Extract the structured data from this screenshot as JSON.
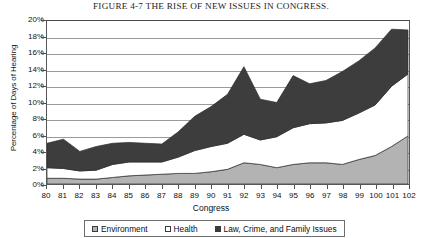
{
  "figure": {
    "title": "FIGURE 4-7  THE RISE OF NEW ISSUES IN CONGRESS."
  },
  "chart_data": {
    "type": "area",
    "stacked": true,
    "title": "FIGURE 4-7  THE RISE OF NEW ISSUES IN CONGRESS.",
    "xlabel": "Congress",
    "ylabel": "Percentage of Days of Hearing",
    "categories": [
      "80",
      "81",
      "82",
      "83",
      "84",
      "85",
      "86",
      "87",
      "88",
      "89",
      "90",
      "91",
      "92",
      "93",
      "94",
      "95",
      "96",
      "97",
      "98",
      "99",
      "100",
      "101",
      "102"
    ],
    "ylim": [
      0,
      20
    ],
    "yticks": [
      "0%",
      "2%",
      "4%",
      "6%",
      "8%",
      "10%",
      "12%",
      "14%",
      "16%",
      "18%",
      "20%"
    ],
    "ytick_values": [
      0,
      2,
      4,
      6,
      8,
      10,
      12,
      14,
      16,
      18,
      20
    ],
    "grid": true,
    "legend_position": "bottom",
    "series": [
      {
        "name": "Environment",
        "color": "#b3b3b3",
        "values": [
          0.7,
          0.7,
          0.6,
          0.6,
          0.8,
          1.0,
          1.1,
          1.2,
          1.3,
          1.3,
          1.5,
          1.8,
          2.6,
          2.4,
          2.0,
          2.4,
          2.6,
          2.6,
          2.4,
          3.0,
          3.5,
          4.6,
          5.9
        ]
      },
      {
        "name": "Health",
        "color": "#ffffff",
        "values": [
          1.3,
          1.2,
          1.0,
          1.1,
          1.6,
          1.7,
          1.6,
          1.5,
          2.0,
          2.8,
          3.1,
          3.2,
          3.5,
          3.0,
          3.8,
          4.5,
          4.8,
          4.9,
          5.4,
          5.7,
          6.2,
          7.4,
          7.6
        ]
      },
      {
        "name": "Law, Crime, and Family Issues",
        "color": "#3d3d3d",
        "values": [
          3.0,
          3.6,
          2.4,
          2.9,
          2.6,
          2.4,
          2.3,
          2.2,
          3.1,
          4.2,
          4.9,
          6.0,
          8.3,
          5.0,
          4.2,
          6.4,
          4.9,
          5.2,
          6.0,
          6.4,
          7.0,
          7.0,
          5.4
        ]
      }
    ],
    "totals": [
      5.0,
      5.5,
      4.0,
      4.6,
      5.0,
      5.1,
      5.0,
      4.9,
      6.4,
      8.3,
      9.5,
      11.0,
      14.4,
      10.4,
      10.0,
      13.3,
      12.3,
      12.7,
      13.8,
      15.1,
      16.7,
      19.0,
      18.9
    ]
  },
  "legend": {
    "items": [
      {
        "label": "Environment",
        "color": "#b3b3b3"
      },
      {
        "label": "Health",
        "color": "#ffffff"
      },
      {
        "label": "Law, Crime, and Family Issues",
        "color": "#3d3d3d"
      }
    ]
  }
}
